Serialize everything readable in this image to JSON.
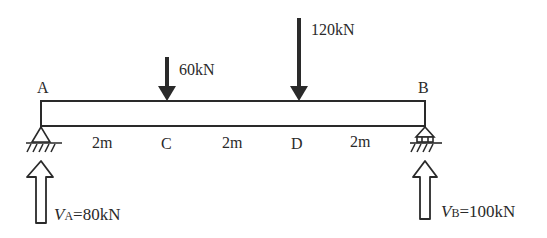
{
  "diagram": {
    "type": "simply-supported-beam",
    "points": {
      "A": "A",
      "B": "B",
      "C": "C",
      "D": "D"
    },
    "spans": [
      "2m",
      "2m",
      "2m"
    ],
    "loads": [
      {
        "at": "C",
        "label": "60kN"
      },
      {
        "at": "D",
        "label": "120kN"
      }
    ],
    "reactions": [
      {
        "at": "A",
        "symbol": "V",
        "subscript": "A",
        "value": "=80kN"
      },
      {
        "at": "B",
        "symbol": "V",
        "subscript": "B",
        "value": "=100kN"
      }
    ],
    "supports": {
      "A": "pin",
      "B": "roller"
    },
    "colors": {
      "ink": "#2a2a2a",
      "background": "#ffffff"
    }
  }
}
